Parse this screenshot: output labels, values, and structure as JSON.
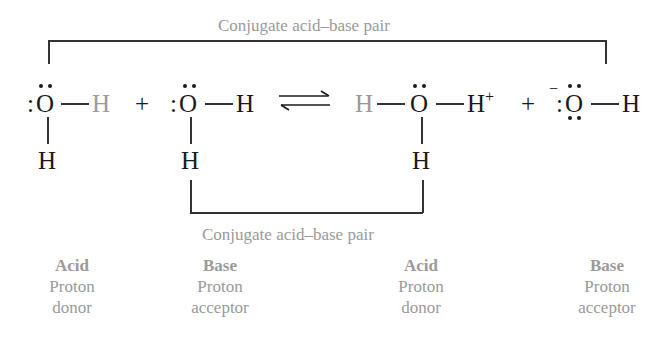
{
  "diagram": {
    "type": "acid-base reaction (water autoionization)",
    "top_bracket_label": "Conjugate acid–base pair",
    "bottom_bracket_label": "Conjugate acid–base pair",
    "plus": "+",
    "species": [
      {
        "id": "water-acid",
        "center": "O",
        "right": "H",
        "right_highlight": true,
        "bottom": "H",
        "lone_pairs": 2,
        "role": "Acid",
        "role_desc_1": "Proton",
        "role_desc_2": "donor"
      },
      {
        "id": "water-base",
        "center": "O",
        "right": "H",
        "bottom": "H",
        "lone_pairs": 2,
        "role": "Base",
        "role_desc_1": "Proton",
        "role_desc_2": "acceptor"
      },
      {
        "id": "hydronium",
        "left": "H",
        "left_highlight": true,
        "center": "O",
        "right": "H",
        "charge": "+",
        "bottom": "H",
        "lone_pairs": 1,
        "role": "Acid",
        "role_desc_1": "Proton",
        "role_desc_2": "donor"
      },
      {
        "id": "hydroxide",
        "center": "O",
        "right": "H",
        "charge": "−",
        "lone_pairs": 3,
        "role": "Base",
        "role_desc_1": "Proton",
        "role_desc_2": "acceptor"
      }
    ],
    "arrow": "equilibrium",
    "colors": {
      "main": "#1a1a1a",
      "highlight_gray": "#9a9a9a",
      "lines": "#333333"
    }
  }
}
